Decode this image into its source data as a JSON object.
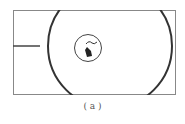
{
  "figure": {
    "caption": "( a )",
    "elements": {
      "frame": "rectangle-border",
      "large_circle": "outer-ring",
      "small_circle": "inner-target-circle",
      "pointer": "hand-cursor-icon",
      "left_line": "horizontal-marker-line"
    },
    "colors": {
      "stroke": "#333333",
      "frame": "#888888"
    }
  }
}
